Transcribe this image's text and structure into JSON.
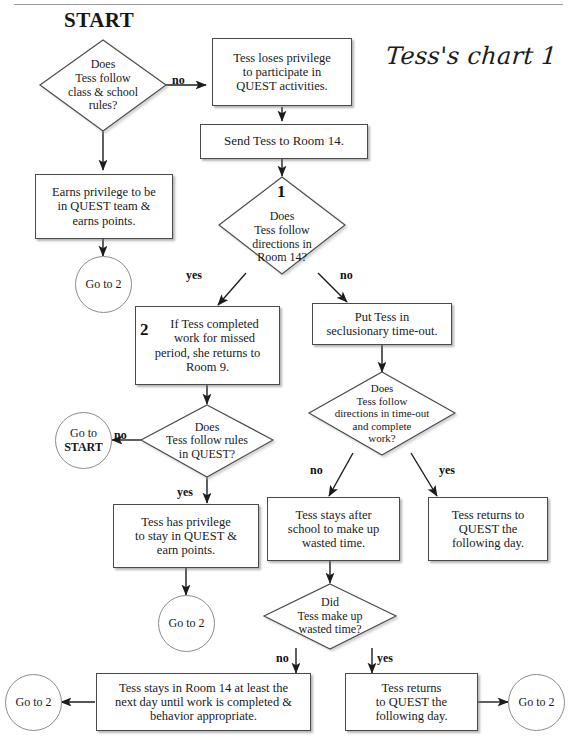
{
  "page": {
    "start_label": "START",
    "chart_title": "Tess's chart 1"
  },
  "nodes": {
    "d1": {
      "line1": "Does",
      "line2": "Tess follow",
      "line3": "class & school",
      "line4": "rules?"
    },
    "b_loses": {
      "line1": "Tess loses privilege",
      "line2": "to participate in",
      "line3": "QUEST activities."
    },
    "b_send": {
      "line1": "Send Tess to Room 14."
    },
    "b_earns": {
      "line1": "Earns privilege to be",
      "line2": "in QUEST team &",
      "line3": "earns points."
    },
    "c_goto2_a": {
      "label": "Go to 2"
    },
    "d2": {
      "tag": "1",
      "line1": "Does",
      "line2": "Tess follow",
      "line3": "directions in",
      "line4": "Room 14?"
    },
    "b_if_completed": {
      "tag": "2",
      "line1": "If Tess completed",
      "line2": "work for missed",
      "line3": "period, she returns to",
      "line4": "Room 9."
    },
    "b_put_tess": {
      "line1": "Put Tess in",
      "line2": "seclusionary time-out."
    },
    "d3": {
      "line1": "Does",
      "line2": "Tess follow rules",
      "line3": "in QUEST?"
    },
    "d4": {
      "line1": "Does",
      "line2": "Tess follow",
      "line3": "directions in time-out",
      "line4": "and complete",
      "line5": "work?"
    },
    "c_goto_start": {
      "line1": "Go to",
      "line2": "START"
    },
    "b_has_priv": {
      "line1": "Tess has privilege",
      "line2": "to stay in QUEST &",
      "line3": "earn points."
    },
    "b_stays_after": {
      "line1": "Tess stays after",
      "line2": "school to make up",
      "line3": "wasted time."
    },
    "b_returns_day": {
      "line1": "Tess returns to",
      "line2": "QUEST the",
      "line3": "following day."
    },
    "c_goto2_b": {
      "label": "Go to 2"
    },
    "d5": {
      "line1": "Did",
      "line2": "Tess make up",
      "line3": "wasted time?"
    },
    "b_stays_room14": {
      "line1": "Tess stays in Room 14 at least the",
      "line2": "next day until work is completed &",
      "line3": "behavior appropriate."
    },
    "b_returns_quest": {
      "line1": "Tess returns",
      "line2": "to QUEST the",
      "line3": "following day."
    },
    "c_goto2_c": {
      "label": "Go to 2"
    },
    "c_goto2_d": {
      "label": "Go to 2"
    }
  },
  "edge_labels": {
    "no_1": "no",
    "yes_1": "yes",
    "no_2": "no",
    "no_3": "no",
    "yes_2": "yes",
    "no_4": "no",
    "yes_3": "yes",
    "no_5": "no",
    "yes_4": "yes"
  },
  "colors": {
    "ink": "#1a1a1a",
    "box_border": "#4a4a4a",
    "circle_border": "#8c8c8c",
    "shadow": "#787878",
    "paper": "#ffffff"
  }
}
